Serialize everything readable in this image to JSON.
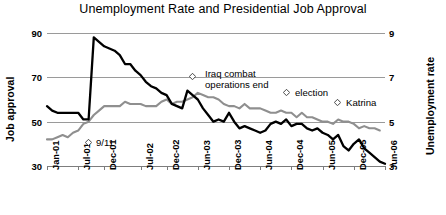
{
  "chart_data": {
    "type": "line",
    "title": "Unemployment Rate and Presidential Job Approval",
    "xlabel": "",
    "ylabel": "Job approval",
    "y2label": "Unemployment rate",
    "ylim": [
      30,
      90
    ],
    "y2lim": [
      3,
      9
    ],
    "yticks": [
      "30",
      "50",
      "70",
      "90"
    ],
    "y2ticks": [
      "3",
      "5",
      "7",
      "9"
    ],
    "grid": true,
    "legend": "none",
    "categories": [
      "Jan-01",
      "Jul-01",
      "Dec-01",
      "Jul-02",
      "Dec-02",
      "Jun-03",
      "Dec-03",
      "Jun-04",
      "Dec-04",
      "Jun-05",
      "Dec-05",
      "Jun-06"
    ],
    "x_range": [
      "Jan-01",
      "Jun-06"
    ],
    "series": [
      {
        "name": "Job approval",
        "axis": "left",
        "color": "#000000",
        "units": "percent approving",
        "x": [
          "Jan-01",
          "Feb-01",
          "Mar-01",
          "Apr-01",
          "May-01",
          "Jun-01",
          "Jul-01",
          "Aug-01",
          "Sep-01",
          "Oct-01",
          "Nov-01",
          "Dec-01",
          "Jan-02",
          "Feb-02",
          "Mar-02",
          "Apr-02",
          "May-02",
          "Jun-02",
          "Jul-02",
          "Aug-02",
          "Sep-02",
          "Oct-02",
          "Nov-02",
          "Dec-02",
          "Jan-03",
          "Feb-03",
          "Mar-03",
          "Apr-03",
          "May-03",
          "Jun-03",
          "Jul-03",
          "Aug-03",
          "Sep-03",
          "Oct-03",
          "Nov-03",
          "Dec-03",
          "Jan-04",
          "Feb-04",
          "Mar-04",
          "Apr-04",
          "May-04",
          "Jun-04",
          "Jul-04",
          "Aug-04",
          "Sep-04",
          "Oct-04",
          "Nov-04",
          "Dec-04",
          "Jan-05",
          "Feb-05",
          "Mar-05",
          "Apr-05",
          "May-05",
          "Jun-05",
          "Jul-05",
          "Aug-05",
          "Sep-05",
          "Oct-05",
          "Nov-05",
          "Dec-05",
          "Jan-06",
          "Feb-06",
          "Mar-06",
          "Apr-06",
          "May-06",
          "Jun-06"
        ],
        "values": [
          57,
          55,
          54,
          54,
          54,
          54,
          54,
          51,
          51,
          88,
          86,
          84,
          83,
          82,
          80,
          76,
          76,
          73,
          71,
          68,
          66,
          65,
          63,
          62,
          58,
          57,
          56,
          64,
          62,
          60,
          56,
          53,
          50,
          51,
          50,
          54,
          50,
          47,
          48,
          47,
          46,
          45,
          46,
          49,
          50,
          49,
          51,
          48,
          49,
          49,
          47,
          46,
          47,
          45,
          44,
          42,
          44,
          39,
          37,
          40,
          42,
          38,
          36,
          34,
          32,
          31
        ]
      },
      {
        "name": "Unemployment rate",
        "axis": "right",
        "color": "#8f8f8f",
        "units": "percent",
        "x": [
          "Jan-01",
          "Feb-01",
          "Mar-01",
          "Apr-01",
          "May-01",
          "Jun-01",
          "Jul-01",
          "Aug-01",
          "Sep-01",
          "Oct-01",
          "Nov-01",
          "Dec-01",
          "Jan-02",
          "Feb-02",
          "Mar-02",
          "Apr-02",
          "May-02",
          "Jun-02",
          "Jul-02",
          "Aug-02",
          "Sep-02",
          "Oct-02",
          "Nov-02",
          "Dec-02",
          "Jan-03",
          "Feb-03",
          "Mar-03",
          "Apr-03",
          "May-03",
          "Jun-03",
          "Jul-03",
          "Aug-03",
          "Sep-03",
          "Oct-03",
          "Nov-03",
          "Dec-03",
          "Jan-04",
          "Feb-04",
          "Mar-04",
          "Apr-04",
          "May-04",
          "Jun-04",
          "Jul-04",
          "Aug-04",
          "Sep-04",
          "Oct-04",
          "Nov-04",
          "Dec-04",
          "Jan-05",
          "Feb-05",
          "Mar-05",
          "Apr-05",
          "May-05",
          "Jun-05",
          "Jul-05",
          "Aug-05",
          "Sep-05",
          "Oct-05",
          "Nov-05",
          "Dec-05",
          "Jan-06",
          "Feb-06",
          "Mar-06",
          "Apr-06",
          "May-06"
        ],
        "values": [
          4.2,
          4.2,
          4.3,
          4.4,
          4.3,
          4.5,
          4.6,
          4.9,
          5.0,
          5.3,
          5.5,
          5.7,
          5.7,
          5.7,
          5.7,
          5.9,
          5.8,
          5.8,
          5.8,
          5.7,
          5.7,
          5.7,
          5.9,
          6.0,
          5.8,
          5.9,
          5.9,
          6.0,
          6.1,
          6.3,
          6.2,
          6.1,
          6.1,
          6.0,
          5.8,
          5.7,
          5.7,
          5.6,
          5.8,
          5.6,
          5.6,
          5.6,
          5.5,
          5.4,
          5.4,
          5.5,
          5.4,
          5.4,
          5.2,
          5.4,
          5.2,
          5.2,
          5.1,
          5.0,
          5.0,
          4.9,
          5.1,
          5.0,
          5.0,
          4.9,
          4.7,
          4.8,
          4.7,
          4.7,
          4.6
        ]
      }
    ],
    "annotations": [
      {
        "id": "nine-eleven",
        "label": "9/11",
        "marker_x": "Sep-01",
        "text_align": "left"
      },
      {
        "id": "iraq-combat",
        "label": "Iraq combat\noperations end",
        "label_line1": "Iraq combat",
        "label_line2": "operations end",
        "marker_x": "May-03",
        "text_align": "left"
      },
      {
        "id": "election",
        "label": "election",
        "marker_x": "Nov-04",
        "text_align": "left"
      },
      {
        "id": "katrina",
        "label": "Katrina",
        "marker_x": "Aug-05",
        "text_align": "left"
      }
    ]
  },
  "colors": {
    "approval_line": "#000000",
    "unemployment_line": "#8f8f8f",
    "gridline": "#9a9a9a",
    "background": "#ffffff",
    "text": "#000000"
  }
}
